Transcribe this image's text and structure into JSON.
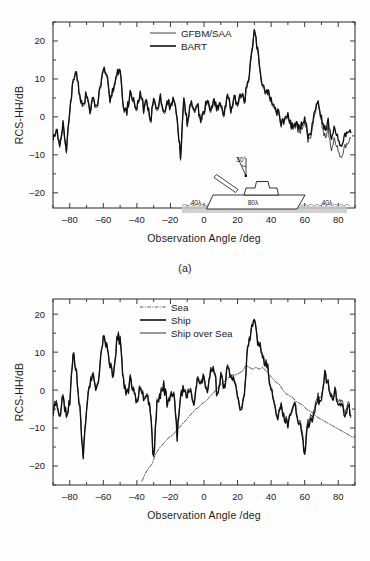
{
  "figure": {
    "background_color": "#fefefe",
    "line_color": "#111111",
    "axis_color": "#3a3a3a"
  },
  "panels": [
    {
      "id": "a",
      "caption": "(a)",
      "xlabel": "Observation Angle /deg",
      "ylabel": "RCS-HH/dB",
      "xticks": [
        "-80",
        "-60",
        "-40",
        "-20",
        "0",
        "20",
        "40",
        "60",
        "80"
      ],
      "yticks": [
        "20",
        "10",
        "0",
        "-10",
        "-20"
      ],
      "legend": [
        {
          "label": "GFBM/SAA",
          "style": "thin-solid"
        },
        {
          "label": "BART",
          "style": "thick-solid"
        }
      ],
      "inset": {
        "angle_label": "30°",
        "left_extent_label": "40λ",
        "ship_length_label": "80λ",
        "right_extent_label": "40λ"
      }
    },
    {
      "id": "b",
      "caption": "(b)",
      "xlabel": "Observation Angle /deg",
      "ylabel": "RCS-HH/dB",
      "xticks": [
        "-80",
        "-60",
        "-40",
        "-20",
        "0",
        "20",
        "40",
        "60",
        "80"
      ],
      "yticks": [
        "20",
        "10",
        "0",
        "-10",
        "-20"
      ],
      "legend": [
        {
          "label": "Sea",
          "style": "dash-dot"
        },
        {
          "label": "Ship",
          "style": "thick-solid"
        },
        {
          "label": "Ship over Sea",
          "style": "thin-solid"
        }
      ]
    }
  ],
  "chart_data": [
    {
      "type": "line",
      "panel": "a",
      "title": "",
      "xlabel": "Observation Angle /deg",
      "ylabel": "RCS-HH/dB",
      "xlim": [
        -90,
        90
      ],
      "ylim": [
        -24,
        25
      ],
      "xticks": [
        -80,
        -60,
        -40,
        -20,
        0,
        20,
        40,
        60,
        80
      ],
      "yticks": [
        20,
        10,
        0,
        -10,
        -20
      ],
      "grid": false,
      "legend_position": "top-center",
      "series": [
        {
          "name": "GFBM/SAA",
          "x": [
            -90,
            -88,
            -86,
            -84,
            -82,
            -80,
            -78,
            -76,
            -74,
            -72,
            -70,
            -68,
            -66,
            -64,
            -62,
            -60,
            -58,
            -56,
            -54,
            -52,
            -50,
            -48,
            -46,
            -44,
            -42,
            -40,
            -38,
            -36,
            -34,
            -32,
            -30,
            -28,
            -26,
            -24,
            -22,
            -20,
            -18,
            -16,
            -14,
            -12,
            -10,
            -8,
            -6,
            -4,
            -2,
            0,
            2,
            4,
            6,
            8,
            10,
            12,
            14,
            16,
            18,
            20,
            22,
            24,
            26,
            28,
            30,
            32,
            34,
            36,
            38,
            40,
            42,
            44,
            46,
            48,
            50,
            52,
            54,
            56,
            58,
            60,
            62,
            64,
            66,
            68,
            70,
            72,
            74,
            76,
            78,
            80,
            82,
            84,
            86,
            88,
            90
          ],
          "y": [
            -6,
            -3.5,
            -8.5,
            -2,
            -9,
            1.5,
            9,
            12.5,
            4.5,
            2,
            6,
            1,
            5,
            1.5,
            7,
            12,
            10,
            5,
            7,
            11,
            12,
            2,
            1,
            6,
            4,
            2,
            6,
            2,
            4,
            -2,
            4,
            1,
            5,
            0,
            4,
            2,
            5,
            -1,
            -11,
            4,
            -2,
            4,
            1,
            3,
            -1,
            1,
            4,
            1,
            4,
            2,
            3,
            0,
            6,
            2,
            5,
            3,
            5,
            4,
            8,
            14,
            23,
            17,
            10,
            7,
            6,
            4,
            2,
            1,
            -2,
            -1,
            0,
            -3,
            -2,
            -4,
            -3,
            -1,
            -6,
            -5,
            1,
            4,
            -1,
            -5,
            -3,
            -8,
            -6,
            -9,
            -11,
            -8,
            -7,
            -5
          ]
        },
        {
          "name": "BART",
          "x": [
            -90,
            -88,
            -86,
            -84,
            -82,
            -80,
            -78,
            -76,
            -74,
            -72,
            -70,
            -68,
            -66,
            -64,
            -62,
            -60,
            -58,
            -56,
            -54,
            -52,
            -50,
            -48,
            -46,
            -44,
            -42,
            -40,
            -38,
            -36,
            -34,
            -32,
            -30,
            -28,
            -26,
            -24,
            -22,
            -20,
            -18,
            -16,
            -14,
            -12,
            -10,
            -8,
            -6,
            -4,
            -2,
            0,
            2,
            4,
            6,
            8,
            10,
            12,
            14,
            16,
            18,
            20,
            22,
            24,
            26,
            28,
            30,
            32,
            34,
            36,
            38,
            40,
            42,
            44,
            46,
            48,
            50,
            52,
            54,
            56,
            58,
            60,
            62,
            64,
            66,
            68,
            70,
            72,
            74,
            76,
            78,
            80,
            82,
            84,
            86,
            88,
            90
          ],
          "y": [
            -6,
            -3,
            -8,
            -1.5,
            -8.5,
            2,
            9.5,
            12.5,
            5,
            2.5,
            6.5,
            1.5,
            5.5,
            2,
            7.5,
            12.5,
            10.5,
            5.5,
            7.5,
            11.5,
            12.5,
            2.5,
            1.5,
            6.5,
            4.5,
            2.5,
            6.5,
            2.5,
            4.5,
            -1.5,
            4.5,
            1.5,
            5.5,
            0.5,
            4.5,
            2.5,
            5.5,
            -0.5,
            -10.5,
            4.5,
            -1.5,
            4.5,
            1.5,
            3.5,
            -0.5,
            1.5,
            4.5,
            1.5,
            4.5,
            2.5,
            3.5,
            0.5,
            6.5,
            2.5,
            5.5,
            3.5,
            5.5,
            4.5,
            8.5,
            14.5,
            23,
            17.5,
            10.5,
            7.5,
            6.5,
            4.5,
            2.5,
            1.5,
            -1.5,
            -0.5,
            0.5,
            -2.5,
            -1.5,
            -3,
            -2,
            0,
            -5,
            -4,
            2,
            4,
            0,
            -3,
            -1,
            -5,
            -3,
            -6,
            -8,
            -5,
            -4,
            -4
          ]
        }
      ],
      "annotations": [
        "30°",
        "40λ",
        "80λ",
        "40λ"
      ]
    },
    {
      "type": "line",
      "panel": "b",
      "title": "",
      "xlabel": "Observation Angle /deg",
      "ylabel": "RCS-HH/dB",
      "xlim": [
        -90,
        90
      ],
      "ylim": [
        -25,
        24
      ],
      "xticks": [
        -80,
        -60,
        -40,
        -20,
        0,
        20,
        40,
        60,
        80
      ],
      "yticks": [
        20,
        10,
        0,
        -10,
        -20
      ],
      "grid": false,
      "legend_position": "top-center",
      "series": [
        {
          "name": "Sea",
          "x": [
            -37,
            -35,
            -33,
            -31,
            -29,
            -27,
            -25,
            -23,
            -21,
            -19,
            -17,
            -15,
            -13,
            -11,
            -9,
            -7,
            -5,
            -3,
            -1,
            1,
            3,
            5,
            7,
            9,
            11,
            13,
            15,
            17,
            19,
            21,
            23,
            25,
            27,
            29,
            31,
            33,
            35,
            37,
            39,
            41,
            43,
            45,
            47,
            49,
            51,
            53,
            55,
            57,
            59,
            61,
            63,
            65,
            67,
            69,
            71,
            73,
            75,
            77,
            79,
            81,
            83,
            85,
            87,
            89,
            90
          ],
          "y": [
            -24,
            -22,
            -20.5,
            -19.5,
            -17,
            -15.5,
            -14.5,
            -13.5,
            -12.5,
            -12,
            -11,
            -10,
            -9,
            -8,
            -7,
            -6,
            -5,
            -4.5,
            -3.5,
            -3,
            -2,
            -1,
            0,
            1,
            2,
            2.5,
            3.5,
            4,
            4,
            4.5,
            5,
            6.5,
            6,
            5.5,
            6,
            5.5,
            6,
            5,
            4,
            3,
            2,
            1.5,
            0,
            -1,
            -1.5,
            -2,
            -3,
            -3.5,
            -4,
            -5,
            -5.5,
            -6,
            -7,
            -7.5,
            -8,
            -8.5,
            -9,
            -9.5,
            -10,
            -10.5,
            -11,
            -11.5,
            -12,
            -12.5,
            -12
          ]
        },
        {
          "name": "Ship",
          "x": [
            -90,
            -88,
            -86,
            -84,
            -82,
            -80,
            -78,
            -76,
            -74,
            -72,
            -70,
            -68,
            -66,
            -64,
            -62,
            -60,
            -58,
            -56,
            -54,
            -52,
            -50,
            -48,
            -46,
            -44,
            -42,
            -40,
            -38,
            -36,
            -34,
            -32,
            -30,
            -28,
            -26,
            -24,
            -22,
            -20,
            -18,
            -16,
            -14,
            -12,
            -10,
            -8,
            -6,
            -4,
            -2,
            0,
            2,
            4,
            6,
            8,
            10,
            12,
            14,
            16,
            18,
            20,
            22,
            24,
            26,
            28,
            30,
            32,
            34,
            36,
            38,
            40,
            42,
            44,
            46,
            48,
            50,
            52,
            54,
            56,
            58,
            60,
            62,
            64,
            66,
            68,
            70,
            72,
            74,
            76,
            78,
            80,
            82,
            84,
            86,
            88,
            90
          ],
          "y": [
            -6,
            -3,
            -6.5,
            -2,
            -7,
            -3,
            10,
            5,
            -5,
            -18,
            -5,
            2,
            4,
            0,
            6,
            14.5,
            11,
            6,
            4,
            13,
            14,
            2,
            -1,
            2,
            0,
            -3,
            2,
            -2,
            -1,
            -5,
            -19,
            -4,
            -1,
            1,
            -3,
            -2,
            0,
            -12,
            -2,
            0,
            -2,
            1,
            -4,
            3,
            2,
            3,
            -1,
            5,
            6,
            -2,
            4,
            1,
            6,
            4,
            2,
            -1,
            -5,
            -2,
            11,
            15,
            18,
            13,
            10,
            8,
            6,
            0,
            -4,
            -7,
            -5,
            -8,
            -9,
            -6,
            -4,
            -8,
            -11,
            -17,
            -9,
            -8,
            -5,
            -3,
            -2,
            4,
            1,
            -2,
            -1,
            -4,
            -3,
            -7,
            -5,
            -6
          ]
        },
        {
          "name": "Ship over Sea",
          "x": [
            -90,
            -88,
            -86,
            -84,
            -82,
            -80,
            -78,
            -76,
            -74,
            -72,
            -70,
            -68,
            -66,
            -64,
            -62,
            -60,
            -58,
            -56,
            -54,
            -52,
            -50,
            -48,
            -46,
            -44,
            -42,
            -40,
            -38,
            -36,
            -34,
            -32,
            -30,
            -28,
            -26,
            -24,
            -22,
            -20,
            -18,
            -16,
            -14,
            -12,
            -10,
            -8,
            -6,
            -4,
            -2,
            0,
            2,
            4,
            6,
            8,
            10,
            12,
            14,
            16,
            18,
            20,
            22,
            24,
            26,
            28,
            30,
            32,
            34,
            36,
            38,
            40,
            42,
            44,
            46,
            48,
            50,
            52,
            54,
            56,
            58,
            60,
            62,
            64,
            66,
            68,
            70,
            72,
            74,
            76,
            78,
            80,
            82,
            84,
            86,
            88,
            90
          ],
          "y": [
            -5,
            -2.5,
            -6,
            -1.5,
            -6.5,
            -2.5,
            10.5,
            5.5,
            -4.5,
            -17,
            -4.5,
            2.5,
            4.5,
            0.5,
            6.5,
            14.5,
            11.5,
            6.5,
            4.5,
            13.5,
            14.5,
            2.5,
            -0.5,
            2.5,
            0.5,
            -2.5,
            2.5,
            -1.5,
            -0.5,
            -4.5,
            -18,
            -3.5,
            -0.5,
            1.5,
            -2.5,
            -1.5,
            0.5,
            -11,
            -1.5,
            0.5,
            -1.5,
            1.5,
            -3.5,
            3.5,
            2.5,
            3.5,
            -0.5,
            5.5,
            6.5,
            -1.5,
            4.5,
            1.5,
            6.5,
            4.5,
            2.5,
            -0.5,
            -4.5,
            -1.5,
            11.5,
            15.5,
            18,
            13.5,
            10.5,
            8.5,
            6.5,
            0.5,
            -3.5,
            -6.5,
            -4.5,
            -7.5,
            -8.5,
            -5.5,
            -3.5,
            -7.5,
            -10,
            -16,
            -8,
            -7,
            -4,
            -2,
            -1,
            4,
            1.5,
            -1.5,
            -0.5,
            -3,
            -2,
            -6,
            -4,
            -7
          ]
        }
      ]
    }
  ]
}
